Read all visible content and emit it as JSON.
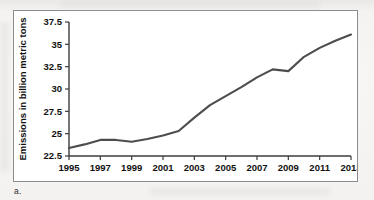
{
  "figure": {
    "caption_label": "a."
  },
  "chart_data": {
    "type": "line",
    "title": "",
    "xlabel": "",
    "ylabel": "Emissions in billion metric tons",
    "xlim": [
      1995,
      2013
    ],
    "ylim": [
      22.5,
      37.5
    ],
    "grid": false,
    "legend": "none",
    "line_color": "#4d4d4d",
    "x_ticks": [
      "1995",
      "1997",
      "1999",
      "2001",
      "2003",
      "2005",
      "2007",
      "2009",
      "2011",
      "2013"
    ],
    "y_ticks": [
      "22.5",
      "25",
      "27.5",
      "30",
      "32.5",
      "35",
      "37.5"
    ],
    "x": [
      1995,
      1996,
      1997,
      1998,
      1999,
      2000,
      2001,
      2002,
      2003,
      2004,
      2005,
      2006,
      2007,
      2008,
      2009,
      2010,
      2011,
      2012,
      2013
    ],
    "values": [
      23.4,
      23.8,
      24.3,
      24.3,
      24.1,
      24.4,
      24.8,
      25.3,
      26.8,
      28.2,
      29.2,
      30.2,
      31.3,
      32.2,
      32.0,
      33.6,
      34.6,
      35.4,
      36.1
    ],
    "series": [
      {
        "name": "Global CO2 emissions",
        "values": [
          23.4,
          23.8,
          24.3,
          24.3,
          24.1,
          24.4,
          24.8,
          25.3,
          26.8,
          28.2,
          29.2,
          30.2,
          31.3,
          32.2,
          32.0,
          33.6,
          34.6,
          35.4,
          36.1
        ]
      }
    ]
  }
}
